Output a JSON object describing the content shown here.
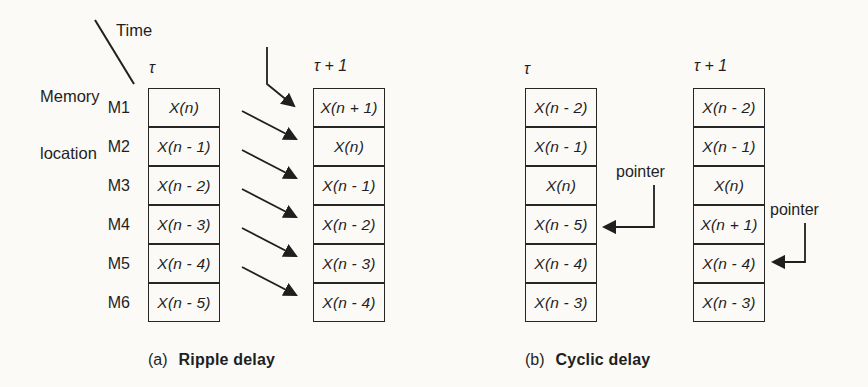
{
  "page_bg": "#fbfaf7",
  "ink": "#1f1f1f",
  "axes": {
    "time_label": "Time",
    "memory_label_line1": "Memory",
    "memory_label_line2": "location"
  },
  "diagram_a": {
    "caption_index": "(a)",
    "caption_title": "Ripple delay",
    "row_labels": [
      "M1",
      "M2",
      "M3",
      "M4",
      "M5",
      "M6"
    ],
    "columns": [
      {
        "header": "τ",
        "cells": [
          "X(n)",
          "X(n - 1)",
          "X(n - 2)",
          "X(n - 3)",
          "X(n - 4)",
          "X(n - 5)"
        ]
      },
      {
        "header": "τ + 1",
        "cells": [
          "X(n + 1)",
          "X(n)",
          "X(n - 1)",
          "X(n - 2)",
          "X(n - 3)",
          "X(n - 4)"
        ]
      }
    ]
  },
  "diagram_b": {
    "caption_index": "(b)",
    "caption_title": "Cyclic delay",
    "columns": [
      {
        "header": "τ",
        "cells": [
          "X(n - 2)",
          "X(n - 1)",
          "X(n)",
          "X(n - 5)",
          "X(n - 4)",
          "X(n - 3)"
        ],
        "pointer": {
          "label": "pointer",
          "row": 4
        }
      },
      {
        "header": "τ + 1",
        "cells": [
          "X(n - 2)",
          "X(n - 1)",
          "X(n)",
          "X(n + 1)",
          "X(n - 4)",
          "X(n - 3)"
        ],
        "pointer": {
          "label": "pointer",
          "row": 5
        }
      }
    ]
  }
}
